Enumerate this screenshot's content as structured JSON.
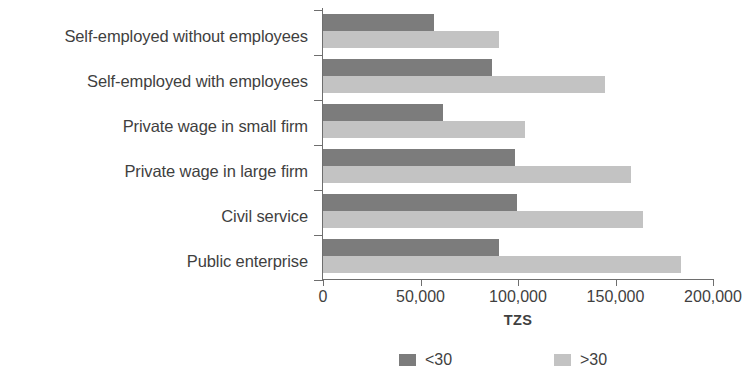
{
  "chart_data": {
    "type": "bar",
    "orientation": "horizontal",
    "title": "",
    "xlabel": "TZS",
    "ylabel": "",
    "xlim": [
      0,
      200000
    ],
    "grid": false,
    "legend_position": "bottom",
    "xticks": [
      "0",
      "50,000",
      "100,000",
      "150,000",
      "200,000"
    ],
    "xtick_values": [
      0,
      50000,
      100000,
      150000,
      200000
    ],
    "categories": [
      "Self-employed without employees",
      "Self-employed with employees",
      "Private wage in small firm",
      "Private wage in large firm",
      "Civil service",
      "Public enterprise"
    ],
    "series": [
      {
        "name": "<30",
        "color": "#7c7c7c",
        "values": [
          56800,
          86800,
          61600,
          98400,
          99500,
          90500
        ]
      },
      {
        "name": ">30",
        "color": "#c3c3c3",
        "values": [
          90500,
          144700,
          103700,
          157900,
          164200,
          183700
        ]
      }
    ]
  },
  "axis": {
    "x_title": "TZS"
  },
  "legend": {
    "items": [
      {
        "label": "<30",
        "color": "#7c7c7c"
      },
      {
        "label": ">30",
        "color": "#c3c3c3"
      }
    ]
  }
}
